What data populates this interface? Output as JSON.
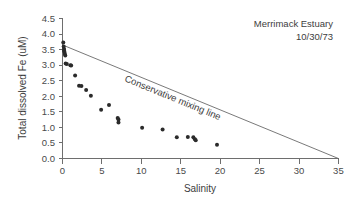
{
  "chart_data": {
    "type": "scatter",
    "title": "",
    "xlabel": "Salinity",
    "ylabel": "Total dissolved Fe (uM)",
    "xlim": [
      0,
      35
    ],
    "ylim": [
      0.0,
      4.5
    ],
    "xticks": [
      "0",
      "5",
      "10",
      "15",
      "20",
      "25",
      "30",
      "35"
    ],
    "xtick_values": [
      0,
      5,
      10,
      15,
      20,
      25,
      30,
      35
    ],
    "yticks": [
      "0.0",
      "0.5",
      "1.0",
      "1.5",
      "2.0",
      "2.5",
      "3.0",
      "3.5",
      "4.0",
      "4.5"
    ],
    "ytick_values": [
      0.0,
      0.5,
      1.0,
      1.5,
      2.0,
      2.5,
      3.0,
      3.5,
      4.0,
      4.5
    ],
    "grid": false,
    "legend": "none",
    "marker_color": "#2b2b2b",
    "line_color": "#6a6a6a",
    "series": [
      {
        "name": "Total dissolved Fe",
        "marker": "circle",
        "points": [
          [
            0.1,
            3.73
          ],
          [
            0.15,
            3.6
          ],
          [
            0.2,
            3.52
          ],
          [
            0.2,
            3.46
          ],
          [
            0.25,
            3.42
          ],
          [
            0.3,
            3.36
          ],
          [
            0.35,
            3.31
          ],
          [
            0.4,
            3.05
          ],
          [
            0.55,
            3.04
          ],
          [
            1.0,
            3.0
          ],
          [
            1.1,
            2.99
          ],
          [
            1.6,
            2.67
          ],
          [
            2.1,
            2.34
          ],
          [
            2.4,
            2.33
          ],
          [
            3.0,
            2.2
          ],
          [
            3.6,
            2.02
          ],
          [
            4.9,
            1.57
          ],
          [
            5.9,
            1.72
          ],
          [
            7.0,
            1.3
          ],
          [
            7.1,
            1.25
          ],
          [
            7.1,
            1.16
          ],
          [
            10.1,
            0.99
          ],
          [
            12.7,
            0.93
          ],
          [
            14.5,
            0.68
          ],
          [
            15.9,
            0.69
          ],
          [
            16.6,
            0.68
          ],
          [
            16.8,
            0.62
          ],
          [
            16.9,
            0.59
          ],
          [
            19.6,
            0.44
          ]
        ]
      }
    ],
    "reference_line": {
      "label": "Conservative mixing line",
      "x0": 0,
      "y0": 3.65,
      "x1": 35,
      "y1": 0.0
    },
    "annotations": [
      {
        "name": "site-label",
        "text": "Merrimack Estuary"
      },
      {
        "name": "date-label",
        "text": "10/30/73"
      }
    ]
  }
}
